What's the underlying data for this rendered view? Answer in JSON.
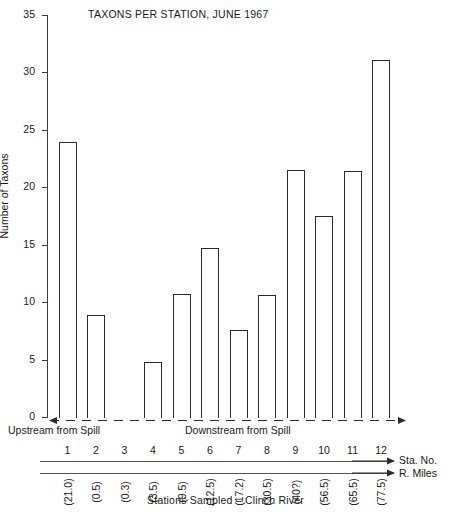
{
  "chart_data": {
    "type": "bar",
    "title": "TAXONS PER STATION, JUNE 1967",
    "xlabel": "Stations Sampled  –  Clinch River",
    "ylabel": "Number of Taxons",
    "ylim": [
      0,
      35
    ],
    "ytick_step": 5,
    "yticks": [
      0,
      5,
      10,
      15,
      20,
      25,
      30,
      35
    ],
    "ytick_labels": [
      "0",
      "5",
      "10",
      "15",
      "20",
      "25",
      "30",
      "35"
    ],
    "grid": false,
    "legend": "none",
    "categories": [
      "1",
      "2",
      "3",
      "4",
      "5",
      "6",
      "7",
      "8",
      "9",
      "10",
      "11",
      "12"
    ],
    "values": [
      24.0,
      9.0,
      0,
      4.9,
      10.8,
      14.8,
      7.7,
      10.7,
      21.6,
      17.6,
      21.5,
      31.2
    ],
    "river_miles": [
      "(21.0)",
      "(0.5)",
      "(0.3)",
      "(3.5)",
      "(9.5)",
      "(12.5)",
      "(17.2)",
      "(30.5)",
      "(40?)",
      "(56.5)",
      "(65.5)",
      "(77.5)"
    ],
    "annotations": [
      "Upstream from Spill",
      "Downstream from Spill",
      "Sta. No.",
      "R. Miles"
    ]
  },
  "axis": {
    "upstream_label": "Upstream from Spill",
    "downstream_label": "Downstream from Spill",
    "sta_no_label": "Sta. No.",
    "r_miles_label": "R. Miles"
  },
  "colors": {
    "bar_outline": "#2b2b2b",
    "bar_fill": "#ffffff",
    "axis": "#3d3d3d",
    "text": "#1a1a1a",
    "background": "#ffffff"
  }
}
